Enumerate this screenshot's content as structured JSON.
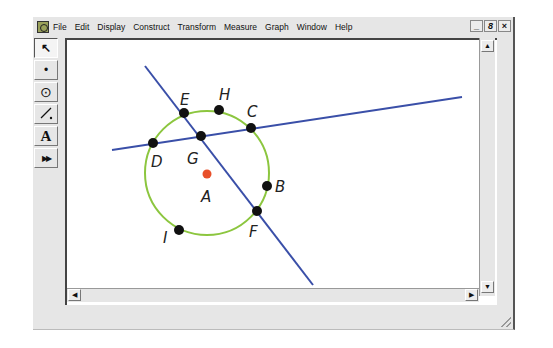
{
  "menubar": {
    "items": [
      "File",
      "Edit",
      "Display",
      "Construct",
      "Transform",
      "Measure",
      "Graph",
      "Window",
      "Help"
    ],
    "controls": {
      "minimize": "_",
      "restore": "8",
      "close": "×"
    }
  },
  "toolbox": {
    "tools": [
      {
        "name": "selection-arrow-tool",
        "glyph": "↖"
      },
      {
        "name": "point-tool",
        "glyph": "•"
      },
      {
        "name": "compass-tool",
        "glyph": "⊙"
      },
      {
        "name": "straightedge-tool",
        "glyph": "⁄"
      },
      {
        "name": "text-tool",
        "glyph": "A"
      },
      {
        "name": "custom-tool",
        "glyph": "▶▶"
      }
    ]
  },
  "scrollbars": {
    "up": "▲",
    "down": "▼",
    "left": "◀",
    "right": "▶"
  },
  "sketch": {
    "circle": {
      "center": "A",
      "color": "#8cc63f"
    },
    "line_color": "#3a4fa8",
    "center_point_color": "#e8502a",
    "points": [
      {
        "label": "E",
        "color": "#111111"
      },
      {
        "label": "H",
        "color": "#111111"
      },
      {
        "label": "C",
        "color": "#111111"
      },
      {
        "label": "D",
        "color": "#111111"
      },
      {
        "label": "G",
        "color": "#111111"
      },
      {
        "label": "A",
        "color": "#e8502a"
      },
      {
        "label": "B",
        "color": "#111111"
      },
      {
        "label": "F",
        "color": "#111111"
      },
      {
        "label": "I",
        "color": "#111111"
      }
    ]
  }
}
